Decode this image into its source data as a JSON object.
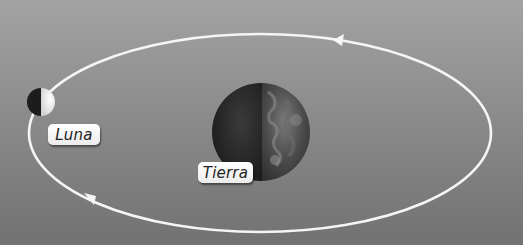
{
  "diagram": {
    "type": "moon-orbit",
    "labels": {
      "moon": "Luna",
      "earth": "Tierra"
    },
    "orbit": {
      "direction": "counter-clockwise",
      "arrows": 2
    },
    "colors": {
      "background_top": "#a3a3a3",
      "background_bottom": "#727272",
      "orbit": "#f5f5f5",
      "label_bg": "#ffffff",
      "label_text": "#222222"
    }
  }
}
